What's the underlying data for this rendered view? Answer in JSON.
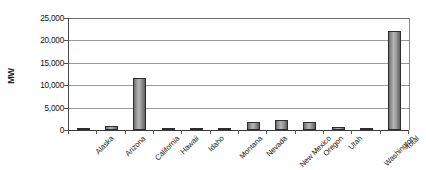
{
  "chart_data": {
    "type": "bar",
    "title": "",
    "subtitle": "",
    "xlabel": "",
    "ylabel": "MW",
    "ylim": [
      0,
      25000
    ],
    "ytick_step": 5000,
    "ytick_labels": [
      "25,000",
      "20,000",
      "15,000",
      "10,000",
      "5,000",
      "0"
    ],
    "ytick_values": [
      25000,
      20000,
      15000,
      10000,
      5000,
      0
    ],
    "grid": true,
    "grid_axis": "y",
    "legend": false,
    "legend_position": "none",
    "bar_color": "#9b9b9b",
    "bar_edge_color": "#2e2e2e",
    "categories": [
      "Alaska",
      "Arizona",
      "California",
      "Hawaii",
      "Idaho",
      "Montana",
      "Nevada",
      "New Mexico",
      "Oregon",
      "Utah",
      "Washington",
      "Total"
    ],
    "values": [
      150,
      1000,
      11500,
      150,
      300,
      100,
      1750,
      2200,
      1900,
      650,
      150,
      22000
    ],
    "units": "MW"
  },
  "axis": {
    "y_title": "MW"
  }
}
